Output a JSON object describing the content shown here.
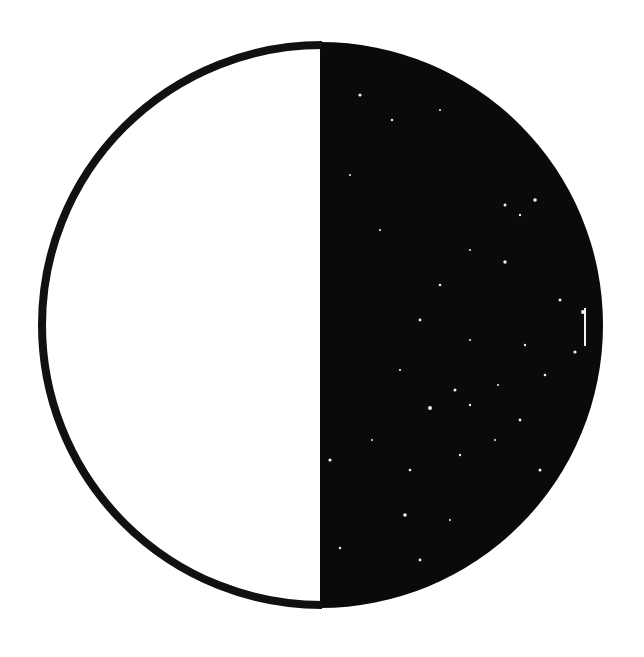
{
  "figure": {
    "type": "moon-phase-symbol",
    "phase": "first-quarter",
    "colors": {
      "background": "#ffffff",
      "lit_half": "#ffffff",
      "dark_half": "#0a0a0a",
      "outline": "#111111",
      "specks": "#f2f2f2"
    }
  }
}
